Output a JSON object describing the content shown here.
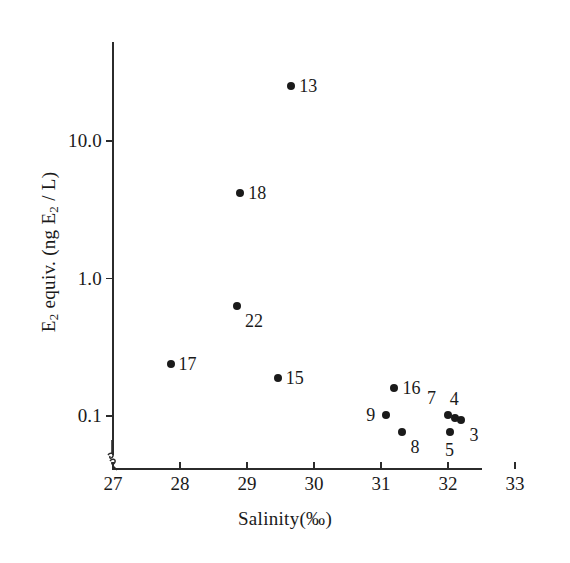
{
  "chart_data": {
    "type": "scatter",
    "title": "",
    "xlabel": "Salinity (‰)",
    "ylabel": "E2 equiv. (ng E2 / L)",
    "ylabel_parts": {
      "lead": "E",
      "sub1": "2",
      "mid": " equiv. (ng E",
      "sub2": "2",
      "tail": " / L)"
    },
    "xlabel_parts": {
      "lead": "Salinity",
      "unit": "(‰)"
    },
    "yscale": "log",
    "xscale": "linear",
    "xlim": [
      27,
      33.2
    ],
    "ylim": [
      0.06,
      40
    ],
    "grid": false,
    "legend": false,
    "axis_break": true,
    "axis_break_note": "break symbol on y-axis just above x-axis origin",
    "xticks": [
      27,
      28,
      29,
      30,
      31,
      32,
      33
    ],
    "xticklabels": [
      "27",
      "28",
      "29",
      "30",
      "31",
      "32",
      "33"
    ],
    "yticks": [
      10.0,
      1.0,
      0.1
    ],
    "yticklabels": [
      "10.0",
      "1.0",
      "0.1"
    ],
    "marker": "filled-circle",
    "marker_color": "#1a1a1a",
    "points": [
      {
        "label": "13",
        "x": 29.66,
        "y": 25.0,
        "label_side": "right"
      },
      {
        "label": "18",
        "x": 28.9,
        "y": 4.2,
        "label_side": "right"
      },
      {
        "label": "22",
        "x": 28.85,
        "y": 0.63,
        "label_side": "below-right"
      },
      {
        "label": "17",
        "x": 27.86,
        "y": 0.24,
        "label_side": "right"
      },
      {
        "label": "15",
        "x": 29.46,
        "y": 0.19,
        "label_side": "right"
      },
      {
        "label": "16",
        "x": 31.2,
        "y": 0.16,
        "label_side": "right"
      },
      {
        "label": "9",
        "x": 31.08,
        "y": 0.101,
        "label_side": "left"
      },
      {
        "label": "8",
        "x": 31.32,
        "y": 0.077,
        "label_side": "below-right"
      },
      {
        "label": "7",
        "x": 32.0,
        "y": 0.101,
        "label_side": "above-left"
      },
      {
        "label": "4",
        "x": 32.1,
        "y": 0.096,
        "label_side": "above"
      },
      {
        "label": "3",
        "x": 32.2,
        "y": 0.094,
        "label_side": "below-right"
      },
      {
        "label": "5",
        "x": 32.03,
        "y": 0.076,
        "label_side": "below"
      }
    ]
  }
}
